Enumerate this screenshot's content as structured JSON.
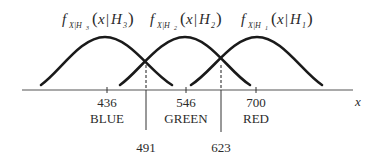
{
  "diagram": {
    "type": "class-conditional-densities",
    "axis_variable": "x",
    "curves": [
      {
        "id": "H3",
        "label_func": "f",
        "label_sub": "X|H",
        "label_sub_index": "3",
        "label_arg": "x",
        "label_cond": "H",
        "label_cond_index": "3",
        "class": "BLUE",
        "mean": "436",
        "peak_x": 105,
        "start_x": 41,
        "end_x": 172
      },
      {
        "id": "H2",
        "label_func": "f",
        "label_sub": "X|H",
        "label_sub_index": "2",
        "label_arg": "x",
        "label_cond": "H",
        "label_cond_index": "2",
        "class": "GREEN",
        "mean": "546",
        "peak_x": 185,
        "start_x": 120,
        "end_x": 250
      },
      {
        "id": "H1",
        "label_func": "f",
        "label_sub": "X|H",
        "label_sub_index": "1",
        "label_arg": "x",
        "label_cond": "H",
        "label_cond_index": "1",
        "class": "RED",
        "mean": "700",
        "peak_x": 257,
        "start_x": 191,
        "end_x": 322
      }
    ],
    "ticks": [
      {
        "value": "436",
        "class_label": "BLUE"
      },
      {
        "value": "546",
        "class_label": "GREEN"
      },
      {
        "value": "700",
        "class_label": "RED"
      }
    ],
    "thresholds": [
      {
        "value": "491"
      },
      {
        "value": "623"
      }
    ],
    "colors": {
      "line": "#1a1a1a",
      "text": "#2b2b2b",
      "background": "#ffffff"
    }
  }
}
